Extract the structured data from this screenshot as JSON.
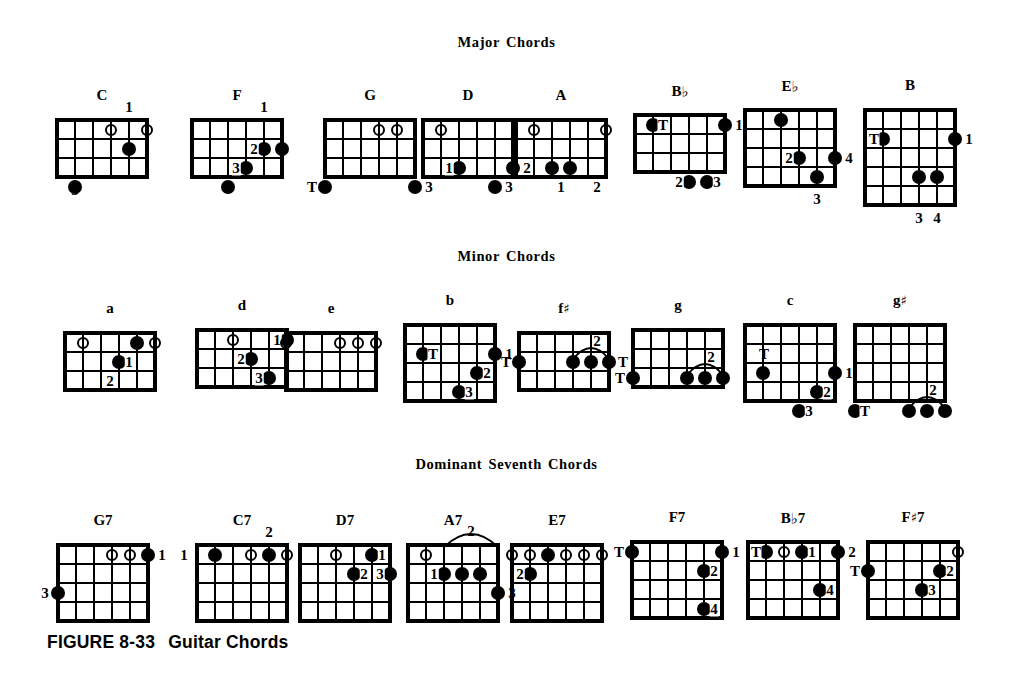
{
  "figure": {
    "caption_label": "FIGURE 8-33",
    "caption_title": "Guitar Chords"
  },
  "sections": [
    {
      "id": "major",
      "title": "Major Chords"
    },
    {
      "id": "minor",
      "title": "Minor Chords"
    },
    {
      "id": "dominant",
      "title": "Dominant Seventh Chords"
    }
  ],
  "legend": {
    "dot": "fretted note (filled circle)",
    "open": "open string (hollow circle)",
    "thumb": "T = thumb",
    "numbers": "1-4 = fingering"
  },
  "chord_data": {
    "type": "diagram",
    "strings": 6,
    "note": "Columns are strings 1(left)-6(right) as drawn; rows are frets.",
    "chords": [
      {
        "name": "C",
        "section": "major",
        "x": 57,
        "y": 120,
        "cols": 5,
        "rows": 3,
        "dots": [
          {
            "s": 1,
            "f": 3
          },
          {
            "s": 4,
            "f": 1
          }
        ],
        "opens": [
          {
            "s": 3
          },
          {
            "s": 5
          }
        ],
        "labels": [
          {
            "text": "1",
            "where": "above",
            "s": 4
          },
          {
            "text": "3",
            "where": "below",
            "s": 1
          }
        ]
      },
      {
        "name": "F",
        "section": "major",
        "x": 192,
        "y": 120,
        "cols": 5,
        "rows": 3,
        "dots": [
          {
            "s": 2,
            "f": 3
          },
          {
            "s": 3,
            "f": 2
          },
          {
            "s": 4,
            "f": 1
          },
          {
            "s": 5,
            "f": 1
          }
        ],
        "opens": [],
        "labels": [
          {
            "text": "1",
            "where": "above",
            "s": 4
          },
          {
            "text": "2",
            "where": "inline-left",
            "s": 4,
            "f": 1
          },
          {
            "text": "3",
            "where": "inline-left",
            "s": 3,
            "f": 2
          }
        ]
      },
      {
        "name": "G",
        "section": "major",
        "x": 325,
        "y": 120,
        "cols": 5,
        "rows": 3,
        "dots": [
          {
            "s": 0,
            "f": 3
          },
          {
            "s": 5,
            "f": 3
          }
        ],
        "opens": [
          {
            "s": 3
          },
          {
            "s": 4
          }
        ],
        "labels": [
          {
            "text": "T",
            "where": "left",
            "s": 0,
            "f": 3
          },
          {
            "text": "3",
            "where": "right",
            "s": 5,
            "f": 3
          }
        ]
      },
      {
        "name": "D",
        "section": "major",
        "x": 423,
        "y": 120,
        "cols": 5,
        "rows": 3,
        "dots": [
          {
            "s": 2,
            "f": 2
          },
          {
            "s": 5,
            "f": 2
          },
          {
            "s": 4,
            "f": 3
          }
        ],
        "opens": [
          {
            "s": 1
          }
        ],
        "labels": [
          {
            "text": "1",
            "where": "inline-left",
            "s": 2,
            "f": 2
          },
          {
            "text": "2",
            "where": "right",
            "s": 5,
            "f": 2
          },
          {
            "text": "3",
            "where": "right",
            "s": 4,
            "f": 3
          }
        ]
      },
      {
        "name": "A",
        "section": "major",
        "x": 516,
        "y": 120,
        "cols": 5,
        "rows": 3,
        "dots": [
          {
            "s": 2,
            "f": 2
          },
          {
            "s": 3,
            "f": 2
          }
        ],
        "opens": [
          {
            "s": 1
          },
          {
            "s": 5
          }
        ],
        "labels": [
          {
            "text": "1",
            "where": "boxed",
            "s": 2,
            "f": 3
          },
          {
            "text": "2",
            "where": "boxed",
            "s": 4,
            "f": 3
          }
        ]
      },
      {
        "name": "B",
        "flat": true,
        "section": "major",
        "x": 635,
        "y": 115,
        "cols": 5,
        "rows": 3,
        "dots": [
          {
            "s": 1,
            "f": 0
          },
          {
            "s": 5,
            "f": 0
          },
          {
            "s": 3,
            "f": 3
          },
          {
            "s": 4,
            "f": 3
          }
        ],
        "opens": [],
        "labels": [
          {
            "text": "T",
            "where": "inline-right",
            "s": 1,
            "f": 0
          },
          {
            "text": "1",
            "where": "right",
            "s": 5,
            "f": 0
          },
          {
            "text": "2",
            "where": "inline-left",
            "s": 3,
            "f": 3
          },
          {
            "text": "3",
            "where": "inline-right",
            "s": 4,
            "f": 3
          }
        ]
      },
      {
        "name": "E",
        "flat": true,
        "section": "major",
        "x": 745,
        "y": 110,
        "cols": 5,
        "rows": 4,
        "dots": [
          {
            "s": 2,
            "f": 0
          },
          {
            "s": 3,
            "f": 2
          },
          {
            "s": 5,
            "f": 2
          },
          {
            "s": 4,
            "f": 3
          }
        ],
        "opens": [],
        "labels": [
          {
            "text": "2",
            "where": "inline-left",
            "s": 3,
            "f": 2
          },
          {
            "text": "4",
            "where": "right",
            "s": 5,
            "f": 2
          },
          {
            "text": "3",
            "where": "below",
            "s": 4
          }
        ]
      },
      {
        "name": "B",
        "section": "major",
        "x": 865,
        "y": 110,
        "cols": 5,
        "rows": 5,
        "dots": [
          {
            "s": 1,
            "f": 1
          },
          {
            "s": 5,
            "f": 1
          },
          {
            "s": 3,
            "f": 3
          },
          {
            "s": 4,
            "f": 3
          }
        ],
        "opens": [],
        "labels": [
          {
            "text": "T",
            "where": "left-inline",
            "s": 1,
            "f": 1
          },
          {
            "text": "1",
            "where": "right",
            "s": 5,
            "f": 1
          },
          {
            "text": "3",
            "where": "below",
            "s": 3
          },
          {
            "text": "4",
            "where": "below",
            "s": 4
          }
        ]
      },
      {
        "name": "a",
        "section": "minor",
        "x": 65,
        "y": 333,
        "cols": 5,
        "rows": 3,
        "dots": [
          {
            "s": 4,
            "f": 0
          },
          {
            "s": 3,
            "f": 1
          }
        ],
        "opens": [
          {
            "s": 1
          },
          {
            "s": 5
          }
        ],
        "labels": [
          {
            "text": "1",
            "where": "inline-right",
            "s": 3,
            "f": 1
          },
          {
            "text": "2",
            "where": "boxed",
            "s": 2,
            "f": 2
          }
        ]
      },
      {
        "name": "d",
        "section": "minor",
        "x": 197,
        "y": 330,
        "cols": 5,
        "rows": 3,
        "dots": [
          {
            "s": 5,
            "f": 0
          },
          {
            "s": 3,
            "f": 1
          },
          {
            "s": 4,
            "f": 2
          }
        ],
        "opens": [
          {
            "s": 2
          }
        ],
        "labels": [
          {
            "text": "1",
            "where": "inline-left",
            "s": 5,
            "f": 0
          },
          {
            "text": "2",
            "where": "inline-left",
            "s": 3,
            "f": 1
          },
          {
            "text": "3",
            "where": "inline-left",
            "s": 4,
            "f": 2
          }
        ]
      },
      {
        "name": "e",
        "section": "minor",
        "x": 286,
        "y": 333,
        "cols": 5,
        "rows": 3,
        "dots": [],
        "opens": [
          {
            "s": 0
          },
          {
            "s": 3
          },
          {
            "s": 4
          },
          {
            "s": 5
          }
        ],
        "labels": []
      },
      {
        "name": "b",
        "section": "minor",
        "x": 405,
        "y": 325,
        "cols": 5,
        "rows": 4,
        "dots": [
          {
            "s": 1,
            "f": 1
          },
          {
            "s": 5,
            "f": 1
          },
          {
            "s": 4,
            "f": 2
          },
          {
            "s": 3,
            "f": 3
          }
        ],
        "opens": [],
        "labels": [
          {
            "text": "T",
            "where": "inline-right",
            "s": 1,
            "f": 1
          },
          {
            "text": "1",
            "where": "right",
            "s": 5,
            "f": 1
          },
          {
            "text": "2",
            "where": "inline-right",
            "s": 4,
            "f": 2
          },
          {
            "text": "3",
            "where": "inline-right",
            "s": 3,
            "f": 3
          }
        ]
      },
      {
        "name": "f",
        "sharp": true,
        "section": "minor",
        "x": 519,
        "y": 333,
        "cols": 5,
        "rows": 3,
        "dots": [
          {
            "s": 0,
            "f": 1
          },
          {
            "s": 3,
            "f": 1
          },
          {
            "s": 4,
            "f": 1
          },
          {
            "s": 5,
            "f": 1
          }
        ],
        "opens": [],
        "barre": {
          "from_s": 3,
          "to_s": 5,
          "f": 1,
          "label": "2"
        },
        "labels": [
          {
            "text": "T",
            "where": "left",
            "s": 0,
            "f": 1
          },
          {
            "text": "T",
            "where": "right",
            "s": 5,
            "f": 1
          }
        ]
      },
      {
        "name": "g",
        "section": "minor",
        "x": 633,
        "y": 330,
        "cols": 5,
        "rows": 3,
        "dots": [
          {
            "s": 0,
            "f": 2
          },
          {
            "s": 3,
            "f": 2
          },
          {
            "s": 4,
            "f": 2
          },
          {
            "s": 5,
            "f": 2
          }
        ],
        "opens": [],
        "barre": {
          "from_s": 3,
          "to_s": 5,
          "f": 2,
          "label": "2"
        },
        "labels": [
          {
            "text": "T",
            "where": "left",
            "s": 0,
            "f": 2
          }
        ]
      },
      {
        "name": "c",
        "section": "minor",
        "x": 745,
        "y": 325,
        "cols": 5,
        "rows": 4,
        "dots": [
          {
            "s": 1,
            "f": 2
          },
          {
            "s": 5,
            "f": 2
          },
          {
            "s": 4,
            "f": 3
          },
          {
            "s": 3,
            "f": 4
          }
        ],
        "opens": [],
        "labels": [
          {
            "text": "T",
            "where": "above-dot",
            "s": 1,
            "f": 2
          },
          {
            "text": "1",
            "where": "right",
            "s": 5,
            "f": 2
          },
          {
            "text": "2",
            "where": "inline-right",
            "s": 4,
            "f": 3
          },
          {
            "text": "3",
            "where": "inline-right",
            "s": 3,
            "f": 4
          }
        ]
      },
      {
        "name": "g",
        "sharp": true,
        "section": "minor",
        "x": 855,
        "y": 325,
        "cols": 5,
        "rows": 4,
        "dots": [
          {
            "s": 0,
            "f": 4
          },
          {
            "s": 3,
            "f": 4
          },
          {
            "s": 4,
            "f": 4
          },
          {
            "s": 5,
            "f": 4
          }
        ],
        "opens": [],
        "barre": {
          "from_s": 3,
          "to_s": 5,
          "f": 4,
          "label": "2"
        },
        "labels": [
          {
            "text": "T",
            "where": "inline-right",
            "s": 0,
            "f": 4
          }
        ]
      },
      {
        "name": "G7",
        "section": "dominant",
        "x": 58,
        "y": 545,
        "cols": 5,
        "rows": 4,
        "dots": [
          {
            "s": 5,
            "f": 0
          },
          {
            "s": 0,
            "f": 2
          }
        ],
        "opens": [
          {
            "s": 3
          },
          {
            "s": 4
          }
        ],
        "labels": [
          {
            "text": "1",
            "where": "right",
            "s": 5,
            "f": 0
          },
          {
            "text": "3",
            "where": "left",
            "s": 0,
            "f": 2
          }
        ]
      },
      {
        "name": "C7",
        "section": "dominant",
        "x": 197,
        "y": 545,
        "cols": 5,
        "rows": 4,
        "dots": [
          {
            "s": 1,
            "f": 0
          },
          {
            "s": 4,
            "f": 0
          }
        ],
        "opens": [
          {
            "s": 3
          },
          {
            "s": 5
          }
        ],
        "labels": [
          {
            "text": "2",
            "where": "above",
            "s": 4
          },
          {
            "text": "1",
            "where": "left",
            "s": 0,
            "f": 0
          }
        ]
      },
      {
        "name": "D7",
        "section": "dominant",
        "x": 300,
        "y": 545,
        "cols": 5,
        "rows": 4,
        "dots": [
          {
            "s": 4,
            "f": 0
          },
          {
            "s": 3,
            "f": 1
          },
          {
            "s": 5,
            "f": 1
          }
        ],
        "opens": [
          {
            "s": 2
          }
        ],
        "labels": [
          {
            "text": "1",
            "where": "inline-right",
            "s": 4,
            "f": 0
          },
          {
            "text": "2",
            "where": "inline-right",
            "s": 3,
            "f": 1
          },
          {
            "text": "3",
            "where": "inline-left",
            "s": 5,
            "f": 1
          }
        ]
      },
      {
        "name": "A7",
        "section": "dominant",
        "x": 408,
        "y": 545,
        "cols": 5,
        "rows": 4,
        "dots": [
          {
            "s": 2,
            "f": 1
          },
          {
            "s": 3,
            "f": 1
          },
          {
            "s": 4,
            "f": 1
          },
          {
            "s": 5,
            "f": 2
          }
        ],
        "opens": [
          {
            "s": 1
          }
        ],
        "barre": {
          "from_s": 2,
          "to_s": 5,
          "f": -1,
          "label": "2",
          "above": true
        },
        "labels": [
          {
            "text": "1",
            "where": "inline-left",
            "s": 2,
            "f": 1
          },
          {
            "text": "3",
            "where": "right",
            "s": 5,
            "f": 2
          }
        ]
      },
      {
        "name": "E7",
        "section": "dominant",
        "x": 512,
        "y": 545,
        "cols": 5,
        "rows": 4,
        "dots": [
          {
            "s": 2,
            "f": 0
          },
          {
            "s": 1,
            "f": 1
          }
        ],
        "opens": [
          {
            "s": 0
          },
          {
            "s": 1
          },
          {
            "s": 3
          },
          {
            "s": 4
          },
          {
            "s": 5
          }
        ],
        "labels": [
          {
            "text": "2",
            "where": "inline-left",
            "s": 1,
            "f": 1
          }
        ]
      },
      {
        "name": "F7",
        "section": "dominant",
        "x": 632,
        "y": 542,
        "cols": 5,
        "rows": 4,
        "dots": [
          {
            "s": 0,
            "f": 0
          },
          {
            "s": 5,
            "f": 0
          },
          {
            "s": 4,
            "f": 1
          },
          {
            "s": 4,
            "f": 3
          }
        ],
        "opens": [],
        "labels": [
          {
            "text": "T",
            "where": "left",
            "s": 0,
            "f": 0
          },
          {
            "text": "1",
            "where": "right",
            "s": 5,
            "f": 0
          },
          {
            "text": "2",
            "where": "inline-right",
            "s": 4,
            "f": 1
          },
          {
            "text": "4",
            "where": "inline-right",
            "s": 4,
            "f": 3
          }
        ]
      },
      {
        "name": "B",
        "flat": true,
        "suffix": "7",
        "section": "dominant",
        "x": 748,
        "y": 542,
        "cols": 5,
        "rows": 4,
        "dots": [
          {
            "s": 1,
            "f": 0
          },
          {
            "s": 3,
            "f": 0
          },
          {
            "s": 5,
            "f": 0
          },
          {
            "s": 4,
            "f": 2
          }
        ],
        "opens": [
          {
            "s": 2
          }
        ],
        "labels": [
          {
            "text": "T",
            "where": "inline-left",
            "s": 1,
            "f": 0
          },
          {
            "text": "1",
            "where": "inline-right",
            "s": 3,
            "f": 0
          },
          {
            "text": "2",
            "where": "right",
            "s": 5,
            "f": 0
          },
          {
            "text": "4",
            "where": "inline-right",
            "s": 4,
            "f": 2
          }
        ]
      },
      {
        "name": "F",
        "sharp": true,
        "suffix": "7",
        "section": "dominant",
        "x": 868,
        "y": 542,
        "cols": 5,
        "rows": 4,
        "dots": [
          {
            "s": 0,
            "f": 1
          },
          {
            "s": 4,
            "f": 1
          },
          {
            "s": 3,
            "f": 2
          }
        ],
        "opens": [
          {
            "s": 5
          }
        ],
        "labels": [
          {
            "text": "T",
            "where": "left",
            "s": 0,
            "f": 1
          },
          {
            "text": "2",
            "where": "inline-right",
            "s": 4,
            "f": 1
          },
          {
            "text": "3",
            "where": "inline-right",
            "s": 3,
            "f": 2
          }
        ]
      }
    ]
  }
}
